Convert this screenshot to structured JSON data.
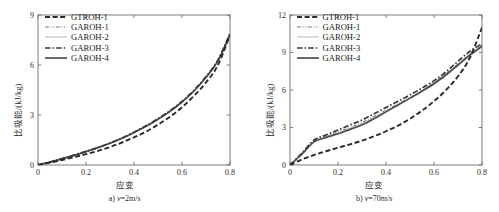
{
  "figure": {
    "panels": [
      {
        "id": "panel-a",
        "caption_index": "a)",
        "caption_var": "v",
        "caption_value": "=2m/s",
        "xlabel": "应变",
        "ylabel": "比吸能/(kJ/kg)",
        "xticks": [
          "0",
          "0.2",
          "0.4",
          "0.6",
          "0.8"
        ],
        "yticks": [
          "0",
          "3",
          "6",
          "9"
        ]
      },
      {
        "id": "panel-b",
        "caption_index": "b)",
        "caption_var": "v",
        "caption_value": "=70m/s",
        "xlabel": "应变",
        "ylabel": "比吸能/(kJ/kg)",
        "xticks": [
          "0",
          "0.2",
          "0.4",
          "0.6",
          "0.8"
        ],
        "yticks": [
          "0",
          "3",
          "6",
          "9",
          "12"
        ]
      }
    ],
    "legend": [
      {
        "label": "GTROH-1",
        "style": "dashed-thick",
        "color": "#2a2a2a"
      },
      {
        "label": "GAROH-1",
        "style": "dash-dot-dot-thin",
        "color": "#555555"
      },
      {
        "label": "GAROH-2",
        "style": "solid-thin-light",
        "color": "#9a9a9a"
      },
      {
        "label": "GAROH-3",
        "style": "dash-dot-thick",
        "color": "#3a3a3a"
      },
      {
        "label": "GAROH-4",
        "style": "solid-thick",
        "color": "#4a4a4a"
      }
    ]
  },
  "chart_data": [
    {
      "type": "line",
      "title": "a) v=2m/s",
      "xlabel": "应变",
      "ylabel": "比吸能/(kJ/kg)",
      "xlim": [
        0,
        0.8
      ],
      "ylim": [
        0,
        9
      ],
      "xticks": [
        0,
        0.2,
        0.4,
        0.6,
        0.8
      ],
      "yticks": [
        0,
        3,
        6,
        9
      ],
      "grid": false,
      "legend_position": "upper-left",
      "x": [
        0,
        0.05,
        0.1,
        0.15,
        0.2,
        0.25,
        0.3,
        0.35,
        0.4,
        0.45,
        0.5,
        0.55,
        0.6,
        0.65,
        0.7,
        0.75,
        0.8
      ],
      "series": [
        {
          "name": "GTROH-1",
          "values": [
            0,
            0.14,
            0.3,
            0.47,
            0.65,
            0.85,
            1.08,
            1.35,
            1.66,
            2.0,
            2.42,
            2.9,
            3.46,
            4.15,
            4.95,
            6.0,
            7.8
          ]
        },
        {
          "name": "GAROH-1",
          "values": [
            0,
            0.17,
            0.37,
            0.58,
            0.8,
            1.03,
            1.3,
            1.6,
            1.95,
            2.33,
            2.76,
            3.24,
            3.8,
            4.45,
            5.25,
            6.25,
            7.85
          ]
        },
        {
          "name": "GAROH-2",
          "values": [
            0,
            0.17,
            0.36,
            0.57,
            0.79,
            1.02,
            1.28,
            1.58,
            1.93,
            2.3,
            2.73,
            3.2,
            3.76,
            4.42,
            5.22,
            6.2,
            7.75
          ]
        },
        {
          "name": "GAROH-3",
          "values": [
            0,
            0.18,
            0.38,
            0.59,
            0.82,
            1.05,
            1.32,
            1.62,
            1.97,
            2.35,
            2.78,
            3.26,
            3.82,
            4.48,
            5.3,
            6.3,
            7.9
          ]
        },
        {
          "name": "GAROH-4",
          "values": [
            0,
            0.17,
            0.37,
            0.58,
            0.8,
            1.04,
            1.3,
            1.6,
            1.95,
            2.32,
            2.75,
            3.22,
            3.78,
            4.44,
            5.26,
            6.26,
            7.8
          ]
        }
      ]
    },
    {
      "type": "line",
      "title": "b) v=70m/s",
      "xlabel": "应变",
      "ylabel": "比吸能/(kJ/kg)",
      "xlim": [
        0,
        0.8
      ],
      "ylim": [
        0,
        12
      ],
      "xticks": [
        0,
        0.2,
        0.4,
        0.6,
        0.8
      ],
      "yticks": [
        0,
        3,
        6,
        9,
        12
      ],
      "grid": false,
      "legend_position": "upper-left",
      "x": [
        0,
        0.05,
        0.1,
        0.15,
        0.2,
        0.25,
        0.3,
        0.35,
        0.4,
        0.45,
        0.5,
        0.55,
        0.6,
        0.65,
        0.7,
        0.75,
        0.8
      ],
      "series": [
        {
          "name": "GTROH-1",
          "values": [
            0,
            0.45,
            0.8,
            1.1,
            1.38,
            1.65,
            1.95,
            2.3,
            2.7,
            3.15,
            3.7,
            4.35,
            5.1,
            6.0,
            7.1,
            8.6,
            11.0
          ]
        },
        {
          "name": "GAROH-1",
          "values": [
            0,
            0.9,
            1.9,
            2.3,
            2.65,
            3.0,
            3.4,
            3.9,
            4.4,
            4.9,
            5.4,
            5.95,
            6.6,
            7.3,
            8.1,
            8.9,
            9.6
          ]
        },
        {
          "name": "GAROH-2",
          "values": [
            0,
            0.85,
            1.8,
            2.2,
            2.55,
            2.9,
            3.3,
            3.8,
            4.3,
            4.8,
            5.35,
            5.95,
            6.6,
            7.3,
            8.05,
            8.8,
            9.5
          ]
        },
        {
          "name": "GAROH-3",
          "values": [
            0,
            0.95,
            2.0,
            2.4,
            2.8,
            3.2,
            3.6,
            4.1,
            4.6,
            5.1,
            5.6,
            6.15,
            6.75,
            7.45,
            8.3,
            9.1,
            9.7
          ]
        },
        {
          "name": "GAROH-4",
          "values": [
            0,
            0.88,
            1.85,
            2.2,
            2.5,
            2.85,
            3.2,
            3.7,
            4.25,
            4.8,
            5.35,
            5.9,
            6.5,
            7.2,
            8.0,
            8.8,
            9.5
          ]
        }
      ]
    }
  ]
}
